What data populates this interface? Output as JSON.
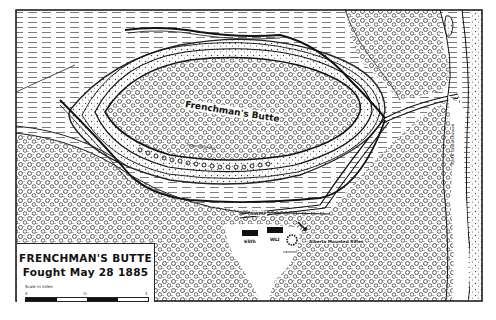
{
  "map": {
    "title": "FRENCHMAN'S BUTTE",
    "subtitle": "Fought May 28 1885",
    "scale": {
      "caption": "Scale in miles",
      "ticks": [
        "0",
        "½",
        "1"
      ]
    },
    "labels": {
      "butte": "Frenchman's Butte",
      "rifle_pits": "Indian Rifle Pits",
      "river": "North Saskatchewan",
      "nwmp": "NWMP",
      "unit_65th": "65th",
      "unit_wli": "WLI",
      "cannon": "cannon",
      "alberta": "Alberta Mounted Rifles"
    },
    "colors": {
      "ink": "#111111",
      "paper": "#ffffff"
    }
  }
}
